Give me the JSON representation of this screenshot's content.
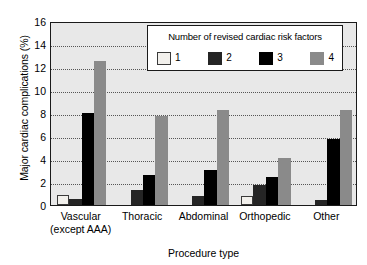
{
  "chart_data": {
    "type": "bar",
    "title": "",
    "xlabel": "Procedure type",
    "ylabel": "Major cardiac complications (%)",
    "ylim": [
      0,
      16
    ],
    "yticks": [
      0,
      2,
      4,
      6,
      8,
      10,
      12,
      14,
      16
    ],
    "grid": true,
    "legend_position": "top-right-inside",
    "legend_title": "Number of revised cardiac risk factors",
    "categories": [
      "Vascular (except AAA)",
      "Thoracic",
      "Abdominal",
      "Orthopedic",
      "Other"
    ],
    "category_lines": [
      [
        "Vascular",
        "(except AAA)"
      ],
      [
        "Thoracic",
        ""
      ],
      [
        "Abdominal",
        ""
      ],
      [
        "Orthopedic",
        ""
      ],
      [
        "Other",
        ""
      ]
    ],
    "series": [
      {
        "name": "1",
        "color": "#f2f0ec",
        "values": [
          0.9,
          0.0,
          0.0,
          0.8,
          0.0
        ]
      },
      {
        "name": "2",
        "color": "#252525",
        "values": [
          0.5,
          1.3,
          0.75,
          1.7,
          0.45
        ]
      },
      {
        "name": "3",
        "color": "#000000",
        "values": [
          8.0,
          2.6,
          3.05,
          2.4,
          5.7
        ]
      },
      {
        "name": "4",
        "color": "#8a8a8a",
        "values": [
          12.55,
          7.7,
          8.3,
          4.1,
          8.3
        ]
      }
    ]
  },
  "colors": {
    "plot_background": "#e8e8e8",
    "axis": "#1a1a1a",
    "grid": "#555555",
    "legend_background": "#ffffff"
  }
}
